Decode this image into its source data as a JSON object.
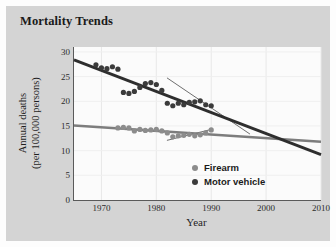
{
  "figure": {
    "title": "Mortality Trends",
    "background_color": "#d4d4d4",
    "plot_background_color": "#fbfbfb"
  },
  "chart_data": {
    "type": "scatter",
    "title": "Mortality Trends",
    "xlabel": "Year",
    "ylabel": "Annual deaths\n(per 100,000 persons)",
    "ylabel_line1": "Annual deaths",
    "ylabel_line2": "(per 100,000 persons)",
    "xlim": [
      1965,
      2010
    ],
    "ylim": [
      0,
      31
    ],
    "xticks": [
      1970,
      1980,
      1990,
      2000,
      2010
    ],
    "yticks": [
      0,
      5,
      10,
      15,
      20,
      25,
      30
    ],
    "grid": true,
    "legend_position": "lower right",
    "series": [
      {
        "name": "Firearm",
        "color": "#8c8c8c",
        "marker": "circle",
        "points": [
          [
            1973,
            14.6
          ],
          [
            1974,
            14.7
          ],
          [
            1975,
            14.6
          ],
          [
            1976,
            14.0
          ],
          [
            1977,
            14.3
          ],
          [
            1978,
            14.1
          ],
          [
            1979,
            14.2
          ],
          [
            1980,
            14.3
          ],
          [
            1981,
            14.0
          ],
          [
            1982,
            13.6
          ],
          [
            1983,
            12.8
          ],
          [
            1984,
            13.0
          ],
          [
            1985,
            13.1
          ],
          [
            1986,
            13.3
          ],
          [
            1987,
            13.0
          ],
          [
            1988,
            13.2
          ],
          [
            1989,
            13.6
          ],
          [
            1990,
            14.2
          ]
        ],
        "trend_line": {
          "x": [
            1965,
            2010
          ],
          "y": [
            15.1,
            11.8
          ],
          "width": 2.6,
          "color": "#7d7d7d"
        },
        "short_trend_line": {
          "x": [
            1982,
            1990
          ],
          "y": [
            12.1,
            14.3
          ],
          "width": 0.8,
          "color": "#4a4a4a"
        }
      },
      {
        "name": "Motor vehicle",
        "color": "#3b3b3b",
        "marker": "circle",
        "points": [
          [
            1969,
            27.4
          ],
          [
            1970,
            26.8
          ],
          [
            1971,
            26.6
          ],
          [
            1972,
            27.0
          ],
          [
            1973,
            26.5
          ],
          [
            1974,
            21.8
          ],
          [
            1975,
            21.6
          ],
          [
            1976,
            22.0
          ],
          [
            1977,
            22.8
          ],
          [
            1978,
            23.6
          ],
          [
            1979,
            23.8
          ],
          [
            1980,
            23.4
          ],
          [
            1981,
            22.2
          ],
          [
            1982,
            19.6
          ],
          [
            1983,
            19.1
          ],
          [
            1984,
            19.6
          ],
          [
            1985,
            19.3
          ],
          [
            1986,
            19.8
          ],
          [
            1987,
            19.9
          ],
          [
            1988,
            20.1
          ],
          [
            1989,
            19.3
          ],
          [
            1990,
            19.1
          ]
        ],
        "trend_line": {
          "x": [
            1965,
            2010
          ],
          "y": [
            28.4,
            9.2
          ],
          "width": 2.8,
          "color": "#2e2e2e"
        },
        "short_trend_line": {
          "x": [
            1982,
            1997
          ],
          "y": [
            24.7,
            13.4
          ],
          "width": 0.8,
          "color": "#4a4a4a"
        }
      }
    ]
  },
  "legend": {
    "items": [
      {
        "label": "Firearm",
        "color": "#8c8c8c"
      },
      {
        "label": "Motor vehicle",
        "color": "#3b3b3b"
      }
    ]
  }
}
